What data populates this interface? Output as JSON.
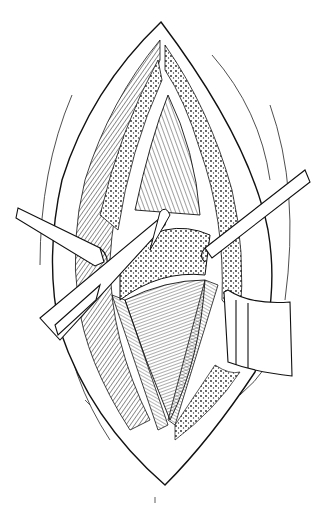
{
  "figure": {
    "description": "Pen-and-ink illustration of an open surgical incision with retractors holding tissue layers apart",
    "style": "black line art on white",
    "colors": {
      "background": "#ffffff",
      "ink": "#111111"
    },
    "elements": [
      {
        "name": "incision-outline",
        "shape": "lens"
      },
      {
        "name": "retractor-left-upper",
        "direction": "left"
      },
      {
        "name": "retractor-left-lower",
        "direction": "left-down"
      },
      {
        "name": "retractor-right-upper",
        "direction": "right-up"
      },
      {
        "name": "retractor-right-blade",
        "direction": "right"
      },
      {
        "name": "muscle-fibers-upper"
      },
      {
        "name": "muscle-fibers-lower"
      },
      {
        "name": "bone-segment"
      }
    ]
  }
}
